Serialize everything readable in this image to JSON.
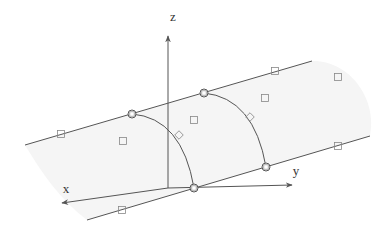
{
  "diagram": {
    "type": "3d-surface-control-net",
    "colors": {
      "line": "#555555",
      "surface": "#f4f4f4",
      "marker": "#888888",
      "background": "#ffffff"
    },
    "axes": {
      "origin": [
        168,
        188
      ],
      "z": {
        "label": "z",
        "end": [
          168,
          36
        ],
        "label_pos": [
          173,
          21
        ]
      },
      "x": {
        "label": "x",
        "end": [
          62,
          203
        ],
        "label_pos": [
          66,
          193
        ]
      },
      "y": {
        "label": "y",
        "end": [
          292,
          185
        ],
        "label_pos": [
          296,
          175
        ]
      }
    },
    "edges": [
      {
        "name": "top-edge",
        "from": [
          25,
          145
        ],
        "to": [
          312,
          61
        ]
      },
      {
        "name": "bottom-edge",
        "from": [
          87,
          220
        ],
        "to": [
          370,
          136
        ]
      }
    ],
    "arcs": [
      {
        "name": "front-arc",
        "from": [
          132,
          114
        ],
        "ctrl": [
          182,
          118
        ],
        "to": [
          194,
          188
        ]
      },
      {
        "name": "back-arc",
        "from": [
          204,
          93
        ],
        "ctrl": [
          254,
          98
        ],
        "to": [
          266,
          167
        ]
      }
    ],
    "circled_points": [
      [
        132,
        114
      ],
      [
        204,
        93
      ],
      [
        194,
        188
      ],
      [
        266,
        167
      ]
    ],
    "diamond_points": [
      [
        179,
        135
      ],
      [
        250,
        117
      ]
    ],
    "square_points": [
      [
        61,
        134
      ],
      [
        123,
        141
      ],
      [
        194,
        120
      ],
      [
        265,
        98
      ],
      [
        275,
        71
      ],
      [
        338,
        77
      ],
      [
        122,
        210
      ],
      [
        338,
        146
      ]
    ]
  }
}
